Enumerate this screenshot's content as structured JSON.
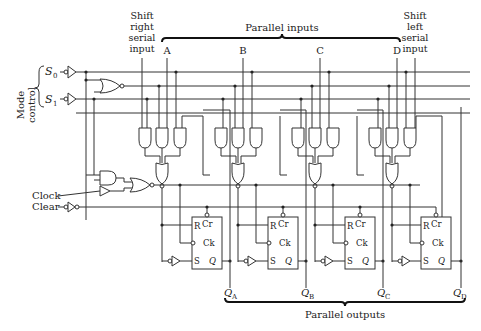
{
  "diagram": {
    "labels": {
      "mode_control": [
        "Mode",
        "control"
      ],
      "s0": "S",
      "s0_sub": "0",
      "s1": "S",
      "s1_sub": "1",
      "shift_right": [
        "Shift",
        "right",
        "serial",
        "input"
      ],
      "shift_left": [
        "Shift",
        "left",
        "serial",
        "input"
      ],
      "parallel_inputs": "Parallel inputs",
      "parallel_outputs": "Parallel outputs",
      "clock": "Clock",
      "clear": "Clear",
      "inputs": [
        "A",
        "B",
        "C",
        "D"
      ],
      "outputs": [
        {
          "q": "Q",
          "sub": "A"
        },
        {
          "q": "Q",
          "sub": "B"
        },
        {
          "q": "Q",
          "sub": "C"
        },
        {
          "q": "Q",
          "sub": "D"
        }
      ],
      "ff_pins": {
        "r": "R",
        "cr": "Cr",
        "ck": "Ck",
        "s": "S",
        "q": "Q"
      }
    },
    "stages": [
      {
        "name": "A",
        "and_gates": 3,
        "nor_gate": 1,
        "flip_flop": "R-S"
      },
      {
        "name": "B",
        "and_gates": 3,
        "nor_gate": 1,
        "flip_flop": "R-S"
      },
      {
        "name": "C",
        "and_gates": 3,
        "nor_gate": 1,
        "flip_flop": "R-S"
      },
      {
        "name": "D",
        "and_gates": 3,
        "nor_gate": 1,
        "flip_flop": "R-S"
      }
    ]
  }
}
